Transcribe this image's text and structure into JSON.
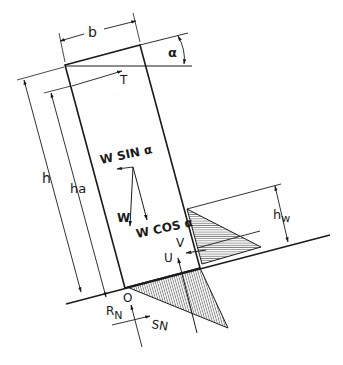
{
  "diagram": {
    "type": "free-body diagram",
    "labels": {
      "width": "b",
      "angle": "α",
      "tension": "T",
      "height": "h",
      "water_affected_height": "ha",
      "weight_sin": "W SIN α",
      "weight": "W",
      "weight_cos": "W COS α",
      "water_height": "h",
      "water_height_sub": "w",
      "horizontal_water_force": "V",
      "uplift": "U",
      "origin": "O",
      "normal_reaction": "R",
      "normal_reaction_sub": "N",
      "shear_force": "SN"
    },
    "colors": {
      "line": "#1a1a1a",
      "hatch": "#333333",
      "background": "#ffffff"
    }
  }
}
